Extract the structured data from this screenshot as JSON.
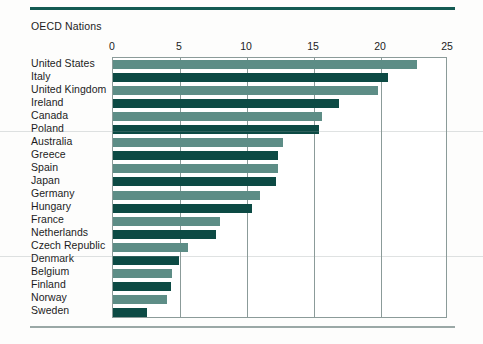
{
  "chart_data": {
    "type": "bar",
    "orientation": "horizontal",
    "title": "OECD Nations",
    "xlabel": "",
    "ylabel": "",
    "xlim": [
      0,
      25
    ],
    "xticks": [
      0,
      5,
      10,
      15,
      20,
      25
    ],
    "xtick_labels": [
      "0",
      "5",
      "10",
      "15",
      "20",
      "25"
    ],
    "grid": "vertical",
    "legend": "none",
    "categories": [
      "United States",
      "Italy",
      "United Kingdom",
      "Ireland",
      "Canada",
      "Poland",
      "Australia",
      "Greece",
      "Spain",
      "Japan",
      "Germany",
      "Hungary",
      "France",
      "Netherlands",
      "Czech Republic",
      "Denmark",
      "Belgium",
      "Finland",
      "Norway",
      "Sweden"
    ],
    "values": [
      22.7,
      20.5,
      19.8,
      16.9,
      15.6,
      15.4,
      12.7,
      12.3,
      12.3,
      12.2,
      11.0,
      10.4,
      8.0,
      7.7,
      5.6,
      4.9,
      4.4,
      4.3,
      4.0,
      2.5
    ],
    "bar_colors": [
      "light",
      "dark",
      "light",
      "dark",
      "light",
      "dark",
      "light",
      "dark",
      "light",
      "dark",
      "light",
      "dark",
      "light",
      "dark",
      "light",
      "dark",
      "light",
      "dark",
      "light",
      "dark"
    ]
  },
  "colors": {
    "bar_light": "#5d8d86",
    "bar_dark": "#0c4a44",
    "rule_top": "#135a52",
    "rule_bottom": "#9aa8a6",
    "axis": "#8b9b99",
    "text": "#1c1c1c",
    "background": "#fdfdfc"
  }
}
